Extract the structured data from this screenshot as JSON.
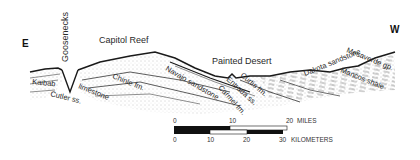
{
  "diagram": {
    "type": "geologic cross-section",
    "directions": {
      "left": "E",
      "right": "W"
    },
    "place_labels": [
      {
        "id": "goosenecks",
        "text": "Goosenecks"
      },
      {
        "id": "capitol_reef",
        "text": "Capitol Reef"
      },
      {
        "id": "painted_desert",
        "text": "Painted Desert"
      }
    ],
    "formation_labels": [
      {
        "id": "kaibab",
        "text": "Kaibab"
      },
      {
        "id": "cutler",
        "text": "Cutler ss."
      },
      {
        "id": "limestone",
        "text": "limestone"
      },
      {
        "id": "chinle",
        "text": "Chinle fm."
      },
      {
        "id": "navajo",
        "text": "Navajo sandstone"
      },
      {
        "id": "carmel",
        "text": "Carmel fm."
      },
      {
        "id": "entrada",
        "text": "Entrada ss."
      },
      {
        "id": "curtis",
        "text": "Curtis fm."
      },
      {
        "id": "dakota",
        "text": "Dakota sandstone"
      },
      {
        "id": "mancos",
        "text": "Mancos shale"
      },
      {
        "id": "mesaverde",
        "text": "Mesaverde gp."
      }
    ],
    "scale_bar": {
      "miles": {
        "ticks": [
          "0",
          "10",
          "20"
        ],
        "unit": "MILES"
      },
      "kilometers": {
        "ticks": [
          "0",
          "10",
          "20",
          "30"
        ],
        "unit": "KILOMETERS"
      }
    },
    "colors": {
      "ink": "#1a1a1a",
      "hatch": "#555555",
      "paper": "#ffffff"
    }
  }
}
